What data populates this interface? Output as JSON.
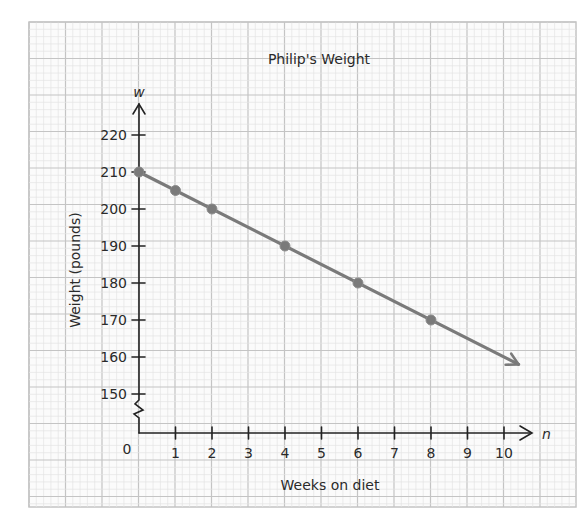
{
  "chart_data": {
    "type": "line",
    "title": "Philip's Weight",
    "xlabel": "Weeks on diet",
    "ylabel": "Weight (pounds)",
    "x_axis_variable": "n",
    "y_axis_variable": "w",
    "origin_label": "0",
    "x_ticks": [
      "1",
      "2",
      "3",
      "4",
      "5",
      "6",
      "7",
      "8",
      "9",
      "10"
    ],
    "y_ticks": [
      "150",
      "160",
      "170",
      "180",
      "190",
      "200",
      "210",
      "220"
    ],
    "xlim": [
      0,
      10.5
    ],
    "ylim": [
      140,
      225
    ],
    "y_axis_break": true,
    "grid": true,
    "series": [
      {
        "name": "Philip's Weight",
        "x": [
          0,
          1,
          2,
          4,
          6,
          8
        ],
        "values": [
          210,
          205,
          200,
          190,
          180,
          170
        ],
        "continues_with_arrow": true,
        "arrow_end": {
          "x": 10.4,
          "y": 158
        },
        "color": "#7a7a7a"
      }
    ]
  },
  "colors": {
    "grid_major": "#c4c4c4",
    "grid_minor": "#e4e4e4",
    "axis": "#222222",
    "line": "#7a7a7a"
  }
}
